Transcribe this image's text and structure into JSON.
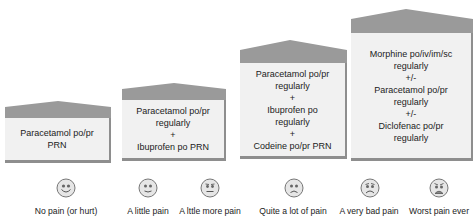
{
  "diagram": {
    "type": "pain-ladder",
    "steps": [
      {
        "level": 1,
        "treatment": "Paracetamol po/pr\nPRN"
      },
      {
        "level": 2,
        "treatment": "Paracetamol po/pr\nregularly\n+\nIbuprofen po PRN"
      },
      {
        "level": 3,
        "treatment": "Paracetamol po/pr\nregularly\n+\nIbuprofen po\nregularly\n+\nCodeine po/pr PRN"
      },
      {
        "level": 4,
        "treatment": "Morphine po/iv/im/sc\nregularly\n+/-\nParacetamol po/pr\nregularly\n+/-\nDiclofenac po/pr\nregularly"
      }
    ],
    "faces": [
      {
        "label": "No pain (or hurt)",
        "icon": "smiling-face-icon"
      },
      {
        "label": "A little pain",
        "icon": "slight-smile-face-icon"
      },
      {
        "label": "A lttle more pain",
        "icon": "neutral-face-icon"
      },
      {
        "label": "Quite a lot of pain",
        "icon": "sad-face-icon"
      },
      {
        "label": "A very bad pain",
        "icon": "very-sad-face-icon"
      },
      {
        "label": "Worst pain ever",
        "icon": "crying-face-icon"
      }
    ],
    "colors": {
      "roof": "#9a9a9a",
      "body": "#f1f1f1",
      "shadow": "#8e8e8e",
      "face": "#e6e6e6"
    }
  }
}
